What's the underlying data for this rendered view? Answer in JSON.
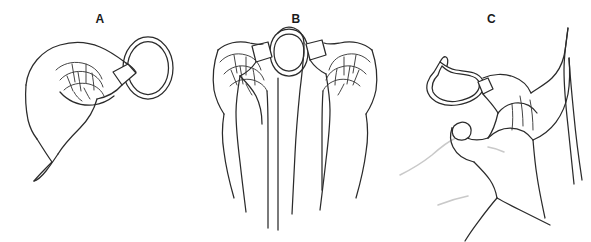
{
  "figure": {
    "kind": "instructional-line-drawing",
    "background_color": "#ffffff",
    "line_color": "#2b2b2b",
    "faint_line_color": "#c9c9c9",
    "label_color": "#1a1a1a"
  },
  "panels": [
    {
      "label": "A",
      "name": "panel-a",
      "caption": "",
      "description": "hand holding uncompressed oval ring between thumb and forefinger"
    },
    {
      "label": "B",
      "name": "panel-b",
      "caption": "",
      "description": "two hands squeezing the ring flat between thumbs and forefingers"
    },
    {
      "label": "C",
      "name": "panel-c",
      "caption": "",
      "description": "compressed ring held by fingers positioned for insertion"
    }
  ]
}
